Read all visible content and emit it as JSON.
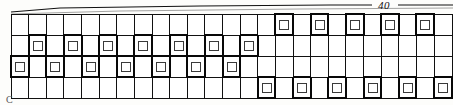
{
  "figure": {
    "type": "engineering-grid-pattern",
    "part_label": "C",
    "dimension": {
      "value": "40",
      "position": "top-right",
      "style": "leader-line"
    }
  },
  "grid": {
    "rows": 4,
    "columns": 25,
    "cell_marker": "small-square",
    "marked_cells": {
      "row_1": [
        16,
        18,
        20,
        22,
        24
      ],
      "row_2": [
        2,
        4,
        6,
        8,
        10,
        12,
        14
      ],
      "row_3": [
        1,
        3,
        5,
        7,
        9,
        11,
        13
      ],
      "row_4": [
        15,
        17,
        19,
        21,
        23,
        25
      ]
    },
    "row_labels": [
      "row-1",
      "row-2",
      "row-3",
      "row-4"
    ]
  },
  "chart_data": {
    "type": "heatmap",
    "title": "",
    "xlabel": "",
    "ylabel": "",
    "categories": [
      1,
      2,
      3,
      4,
      5,
      6,
      7,
      8,
      9,
      10,
      11,
      12,
      13,
      14,
      15,
      16,
      17,
      18,
      19,
      20,
      21,
      22,
      23,
      24,
      25
    ],
    "series": [
      {
        "name": "row-1",
        "values": [
          0,
          0,
          0,
          0,
          0,
          0,
          0,
          0,
          0,
          0,
          0,
          0,
          0,
          0,
          0,
          1,
          0,
          1,
          0,
          1,
          0,
          1,
          0,
          1,
          0
        ]
      },
      {
        "name": "row-2",
        "values": [
          0,
          1,
          0,
          1,
          0,
          1,
          0,
          1,
          0,
          1,
          0,
          1,
          0,
          1,
          0,
          0,
          0,
          0,
          0,
          0,
          0,
          0,
          0,
          0,
          0
        ]
      },
      {
        "name": "row-3",
        "values": [
          1,
          0,
          1,
          0,
          1,
          0,
          1,
          0,
          1,
          0,
          1,
          0,
          1,
          0,
          0,
          0,
          0,
          0,
          0,
          0,
          0,
          0,
          0,
          0,
          0
        ]
      },
      {
        "name": "row-4",
        "values": [
          0,
          0,
          0,
          0,
          0,
          0,
          0,
          0,
          0,
          0,
          0,
          0,
          0,
          0,
          1,
          0,
          1,
          0,
          1,
          0,
          1,
          0,
          1,
          0,
          1
        ]
      }
    ],
    "legend": [
      "unmarked",
      "marked"
    ],
    "grid": true
  },
  "colors": {
    "line": "#111111",
    "marker_stroke": "#3a3a3a",
    "cell_fill": "#ffffff",
    "background": "#fdfdfb",
    "label": "#121212"
  }
}
